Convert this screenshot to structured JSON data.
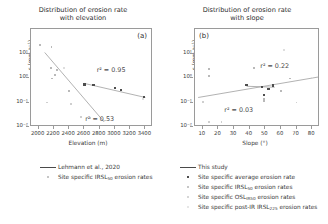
{
  "chart_data": [
    {
      "type": "scatter",
      "panel": "(a)",
      "title": "Distribution of erosion rate with elevation",
      "title_line1": "Distribution of erosion rate",
      "title_line2": "with elevation",
      "xlabel": "Elevation (m)",
      "ylabel": "ε (mm a⁻¹)",
      "xlim": [
        1900,
        3500
      ],
      "ylim": [
        0.01,
        100
      ],
      "yscale": "log",
      "xticks": [
        2000,
        2200,
        2400,
        2600,
        2800,
        3000,
        3200,
        3400
      ],
      "yticks": [
        "10¹",
        "10⁰",
        "10⁻¹",
        "10⁻²"
      ],
      "grid": false,
      "annotations": [
        {
          "text": "r² = 0.95",
          "x": 2950,
          "y": 2.2
        },
        {
          "text": "r² = 0.53",
          "x": 2800,
          "y": 0.022
        }
      ],
      "series": [
        {
          "name": "Site specific average erosion rate",
          "marker": "avg",
          "points": [
            {
              "x": 2600,
              "y": 0.55
            },
            {
              "x": 2720,
              "y": 0.52
            },
            {
              "x": 3000,
              "y": 0.4
            },
            {
              "x": 3080,
              "y": 0.33
            },
            {
              "x": 3380,
              "y": 0.17
            }
          ]
        },
        {
          "name": "Site specific IRSL50 erosion rates",
          "marker": "irsl",
          "points": [
            {
              "x": 2020,
              "y": 22.0
            },
            {
              "x": 2170,
              "y": 18.0
            },
            {
              "x": 2160,
              "y": 2.6
            },
            {
              "x": 2240,
              "y": 2.2
            },
            {
              "x": 2210,
              "y": 1.35
            },
            {
              "x": 2180,
              "y": 0.95
            },
            {
              "x": 2400,
              "y": 0.3
            }
          ]
        },
        {
          "name": "Site specific OSLIR50 erosion rates",
          "marker": "osl",
          "points": [
            {
              "x": 2110,
              "y": 0.1
            },
            {
              "x": 2420,
              "y": 0.085
            },
            {
              "x": 2560,
              "y": 0.026
            },
            {
              "x": 2680,
              "y": 0.024
            }
          ]
        },
        {
          "name": "Site specific post-IR IRSL225 erosion rates",
          "marker": "pir",
          "points": [
            {
              "x": 2330,
              "y": 2.5
            },
            {
              "x": 3370,
              "y": 0.14
            }
          ]
        }
      ],
      "fits": [
        {
          "name": "This study",
          "x0": 2600,
          "y0": 0.6,
          "x1": 3400,
          "y1": 0.16
        },
        {
          "name": "Lehmann et al., 2020",
          "x0": 2080,
          "y0": 11.0,
          "x1": 2860,
          "y1": 0.016
        }
      ]
    },
    {
      "type": "scatter",
      "panel": "(b)",
      "title": "Distribution of erosion rate with slope",
      "title_line1": "Distribution of erosion rate",
      "title_line2": "with slope",
      "xlabel": "Slope (°)",
      "ylabel": "ε (mm a⁻¹)",
      "xlim": [
        5,
        85
      ],
      "ylim": [
        0.01,
        100
      ],
      "yscale": "log",
      "xticks": [
        10,
        20,
        30,
        40,
        50,
        60,
        70,
        80
      ],
      "yticks": [
        "10¹",
        "10⁰",
        "10⁻¹",
        "10⁻²"
      ],
      "grid": false,
      "annotations": [
        {
          "text": "r² = 0.22",
          "x": 56,
          "y": 3.2
        },
        {
          "text": "r² = 0.03",
          "x": 33,
          "y": 0.05
        }
      ],
      "series": [
        {
          "name": "Site specific average erosion rate",
          "marker": "avg",
          "points": [
            {
              "x": 38,
              "y": 0.52
            },
            {
              "x": 48,
              "y": 0.42
            },
            {
              "x": 52,
              "y": 0.35
            },
            {
              "x": 55,
              "y": 0.5
            },
            {
              "x": 49,
              "y": 0.2
            }
          ]
        },
        {
          "name": "Site specific IRSL50 erosion rates",
          "marker": "irsl",
          "points": [
            {
              "x": 14,
              "y": 2.3
            },
            {
              "x": 14,
              "y": 1.25
            },
            {
              "x": 43,
              "y": 2.6
            },
            {
              "x": 66,
              "y": 0.95
            },
            {
              "x": 60,
              "y": 0.3
            },
            {
              "x": 49,
              "y": 0.135
            },
            {
              "x": 49,
              "y": 0.115
            }
          ]
        },
        {
          "name": "Site specific OSLIR50 erosion rates",
          "marker": "osl",
          "points": [
            {
              "x": 10,
              "y": 0.105
            },
            {
              "x": 14,
              "y": 0.016
            },
            {
              "x": 22,
              "y": 0.016
            },
            {
              "x": 70,
              "y": 0.1
            }
          ]
        },
        {
          "name": "Site specific post-IR IRSL225 erosion rates",
          "marker": "pir",
          "points": [
            {
              "x": 62,
              "y": 14.0
            },
            {
              "x": 80,
              "y": 1.05
            }
          ]
        }
      ],
      "fits": [
        {
          "name": "This study",
          "x0": 7,
          "y0": 0.16,
          "x1": 84,
          "y1": 1.1
        },
        {
          "name": "This study flat",
          "x0": 38,
          "y0": 0.46,
          "x1": 56,
          "y1": 0.42
        }
      ]
    }
  ],
  "legend": {
    "left": [
      {
        "marker": "line",
        "label": "Lehmann et al., 2020"
      },
      {
        "marker": "irsl",
        "label_pre": "Site specific IRSL",
        "label_sub": "50",
        "label_post": " erosion rates"
      }
    ],
    "right": [
      {
        "marker": "line",
        "label": "This study"
      },
      {
        "marker": "avg",
        "label_pre": "Site specific average erosion rate",
        "label_sub": "",
        "label_post": ""
      },
      {
        "marker": "irsl",
        "label_pre": "Site specific IRSL",
        "label_sub": "50",
        "label_post": " erosion rates"
      },
      {
        "marker": "osl",
        "label_pre": "Site specific OSL",
        "label_sub": "IR50",
        "label_post": " erosion rates"
      },
      {
        "marker": "pir",
        "label_pre": "Site specific post-IR IRSL",
        "label_sub": "225",
        "label_post": " erosion rates"
      }
    ]
  }
}
